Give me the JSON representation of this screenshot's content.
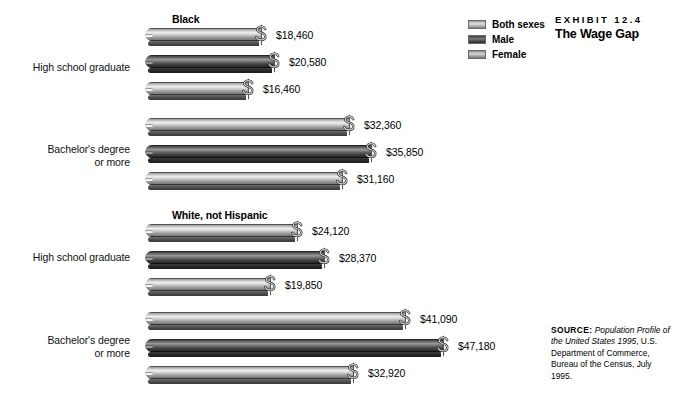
{
  "exhibit": {
    "kicker": "EXHIBIT 12.4",
    "title": "The Wage Gap"
  },
  "legend": {
    "items": [
      {
        "label": "Both sexes",
        "swatch": "light"
      },
      {
        "label": "Male",
        "swatch": "dark"
      },
      {
        "label": "Female",
        "swatch": "mid"
      }
    ]
  },
  "source": {
    "label": "SOURCE:",
    "title": "Population Profile of the United States 1995",
    "rest": ", U.S. Department of Commerce, Bureau of the Census, July 1995."
  },
  "chart_data": {
    "type": "bar",
    "title": "The Wage Gap",
    "xlabel": "",
    "ylabel": "",
    "orientation": "horizontal",
    "value_prefix": "$",
    "xlim": [
      0,
      47180
    ],
    "grid": false,
    "legend_position": "top-right",
    "series": [
      {
        "name": "Both sexes",
        "values": [
          18460,
          32360,
          24120,
          41090
        ]
      },
      {
        "name": "Male",
        "values": [
          20580,
          35850,
          28370,
          47180
        ]
      },
      {
        "name": "Female",
        "values": [
          16460,
          31160,
          19850,
          32920
        ]
      }
    ],
    "groups": [
      {
        "heading": "Black",
        "categories": [
          {
            "label": "High school graduate",
            "bars": [
              {
                "series": "Both sexes",
                "value": 18460,
                "display": "$18,460"
              },
              {
                "series": "Male",
                "value": 20580,
                "display": "$20,580"
              },
              {
                "series": "Female",
                "value": 16460,
                "display": "$16,460"
              }
            ]
          },
          {
            "label": "Bachelor's degree or more",
            "bars": [
              {
                "series": "Both sexes",
                "value": 32360,
                "display": "$32,360"
              },
              {
                "series": "Male",
                "value": 35850,
                "display": "$35,850"
              },
              {
                "series": "Female",
                "value": 31160,
                "display": "$31,160"
              }
            ]
          }
        ]
      },
      {
        "heading": "White, not Hispanic",
        "categories": [
          {
            "label": "High school graduate",
            "bars": [
              {
                "series": "Both sexes",
                "value": 24120,
                "display": "$24,120"
              },
              {
                "series": "Male",
                "value": 28370,
                "display": "$28,370"
              },
              {
                "series": "Female",
                "value": 19850,
                "display": "$19,850"
              }
            ]
          },
          {
            "label": "Bachelor's degree or more",
            "bars": [
              {
                "series": "Both sexes",
                "value": 41090,
                "display": "$41,090"
              },
              {
                "series": "Male",
                "value": 47180,
                "display": "$47,180"
              },
              {
                "series": "Female",
                "value": 32920,
                "display": "$32,920"
              }
            ]
          }
        ]
      }
    ]
  },
  "labels": {
    "high_school": "High school graduate",
    "bachelors_line1": "Bachelor's degree",
    "bachelors_line2": "or more"
  }
}
